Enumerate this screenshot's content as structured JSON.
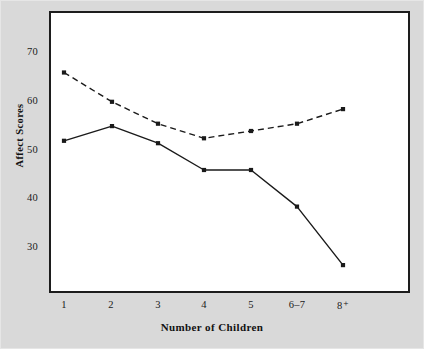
{
  "figure": {
    "background_color": "#d9d9d9",
    "plot_background_color": "#ffffff",
    "frame_color": "#1d1d1d"
  },
  "axis": {
    "ylabel": "Affect Scores",
    "xlabel": "Number of Children",
    "yticks": [
      "70",
      "60",
      "50",
      "40",
      "30"
    ],
    "xticks": [
      "1",
      "2",
      "3",
      "4",
      "5",
      "6–7",
      "8⁺"
    ]
  },
  "chart_data": {
    "type": "line",
    "title": "",
    "xlabel": "Number of Children",
    "ylabel": "Affect Scores",
    "categories": [
      "1",
      "2",
      "3",
      "4",
      "5",
      "6–7",
      "8⁺"
    ],
    "ylim": [
      24,
      72
    ],
    "yticks": [
      30,
      40,
      50,
      60,
      70
    ],
    "grid": false,
    "legend": "none",
    "series": [
      {
        "name": "dashed-series",
        "style": "dashed",
        "color": "#1a1a1a",
        "marker": "square",
        "values": [
          66,
          60,
          55.5,
          52.5,
          54,
          55.5,
          58.5
        ]
      },
      {
        "name": "solid-series",
        "style": "solid",
        "color": "#1a1a1a",
        "marker": "square",
        "values": [
          52,
          55,
          51.5,
          46,
          46,
          38.5,
          26.5
        ]
      }
    ]
  }
}
